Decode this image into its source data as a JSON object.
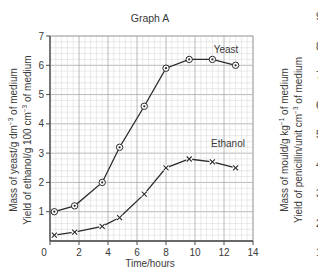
{
  "chart_data": [
    {
      "type": "line",
      "title": "Graph A",
      "xlabel": "Time/hours",
      "ylabel": [
        "Mass of yeast/g dm⁻³ of medium",
        "Yield of ethanol/g 100 cm⁻³ of medium"
      ],
      "xlim": [
        0,
        14
      ],
      "ylim": [
        0,
        7
      ],
      "x_ticks": [
        "0",
        "2",
        "4",
        "6",
        "8",
        "10",
        "12",
        "14"
      ],
      "y_ticks": [
        "1",
        "2",
        "3",
        "4",
        "5",
        "6",
        "7"
      ],
      "grid": true,
      "series": [
        {
          "name": "Yeast",
          "marker": "circled-dot",
          "x": [
            0.3,
            1.7,
            3.6,
            4.8,
            6.5,
            8.0,
            9.6,
            11.2,
            12.8
          ],
          "values": [
            1.0,
            1.2,
            2.0,
            3.2,
            4.6,
            5.9,
            6.2,
            6.2,
            6.0
          ]
        },
        {
          "name": "Ethanol",
          "marker": "x",
          "x": [
            0.3,
            1.7,
            3.6,
            4.8,
            6.5,
            8.0,
            9.6,
            11.2,
            12.8
          ],
          "values": [
            0.2,
            0.3,
            0.5,
            0.8,
            1.6,
            2.5,
            2.8,
            2.7,
            2.5
          ]
        }
      ],
      "annotations": [
        "Yeast",
        "Ethanol"
      ]
    },
    {
      "type": "line",
      "title": "",
      "partial": true,
      "ylabel": [
        "Mass of mould/g kg⁻¹ of medium",
        "Yield of penicillin/unit cm⁻³ of medium"
      ],
      "y_ticks": [
        "1",
        "2",
        "3",
        "4",
        "5",
        "6",
        "7",
        "8",
        "9"
      ]
    }
  ],
  "graph_a": {
    "title": "Graph A",
    "xlabel": "Time/hours",
    "ylabel_line1": "Mass of yeast/g dm",
    "ylabel_line1_sup": "−3",
    "ylabel_line1_end": " of medium",
    "ylabel_line2": "Yield of ethanol/g 100 cm",
    "ylabel_line2_sup": "−3",
    "ylabel_line2_end": " of medium",
    "label_yeast": "Yeast",
    "label_ethanol": "Ethanol"
  },
  "graph_b": {
    "ylabel_line1": "Mass of mould/g kg",
    "ylabel_line1_sup": "−1",
    "ylabel_line1_end": " of medium",
    "ylabel_line2": "Yield of penicillin/unit cm",
    "ylabel_line2_sup": "−3",
    "ylabel_line2_end": " of medium"
  },
  "colors": {
    "grid_minor": "#d4d4d4",
    "grid_major": "#a8a8a8",
    "axis": "#4a4a4a",
    "line": "#2a2a2a",
    "text": "#3a3a3a"
  }
}
